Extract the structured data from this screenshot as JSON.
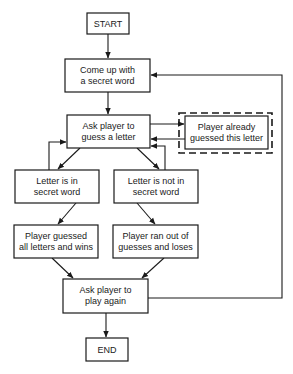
{
  "diagram": {
    "type": "flowchart",
    "nodes": {
      "start": {
        "lines": [
          "START"
        ]
      },
      "secret": {
        "lines": [
          "Come up with",
          "a secret word"
        ]
      },
      "ask_guess": {
        "lines": [
          "Ask player to",
          "guess a letter"
        ]
      },
      "already": {
        "lines": [
          "Player already",
          "guessed this letter"
        ],
        "style": "dashed-outline"
      },
      "in_word": {
        "lines": [
          "Letter is in",
          "secret word"
        ]
      },
      "not_in_word": {
        "lines": [
          "Letter is not in",
          "secret word"
        ]
      },
      "wins": {
        "lines": [
          "Player guessed",
          "all letters and wins"
        ]
      },
      "loses": {
        "lines": [
          "Player ran out of",
          "guesses and loses"
        ]
      },
      "play_again": {
        "lines": [
          "Ask player to",
          "play again"
        ]
      },
      "end": {
        "lines": [
          "END"
        ]
      }
    },
    "edges": [
      {
        "from": "start",
        "to": "secret"
      },
      {
        "from": "secret",
        "to": "ask_guess"
      },
      {
        "from": "ask_guess",
        "to": "already"
      },
      {
        "from": "already",
        "to": "ask_guess"
      },
      {
        "from": "ask_guess",
        "to": "in_word"
      },
      {
        "from": "ask_guess",
        "to": "not_in_word"
      },
      {
        "from": "in_word",
        "to": "ask_guess"
      },
      {
        "from": "not_in_word",
        "to": "ask_guess"
      },
      {
        "from": "in_word",
        "to": "wins"
      },
      {
        "from": "not_in_word",
        "to": "loses"
      },
      {
        "from": "wins",
        "to": "play_again"
      },
      {
        "from": "loses",
        "to": "play_again"
      },
      {
        "from": "play_again",
        "to": "secret"
      },
      {
        "from": "play_again",
        "to": "end"
      }
    ]
  }
}
